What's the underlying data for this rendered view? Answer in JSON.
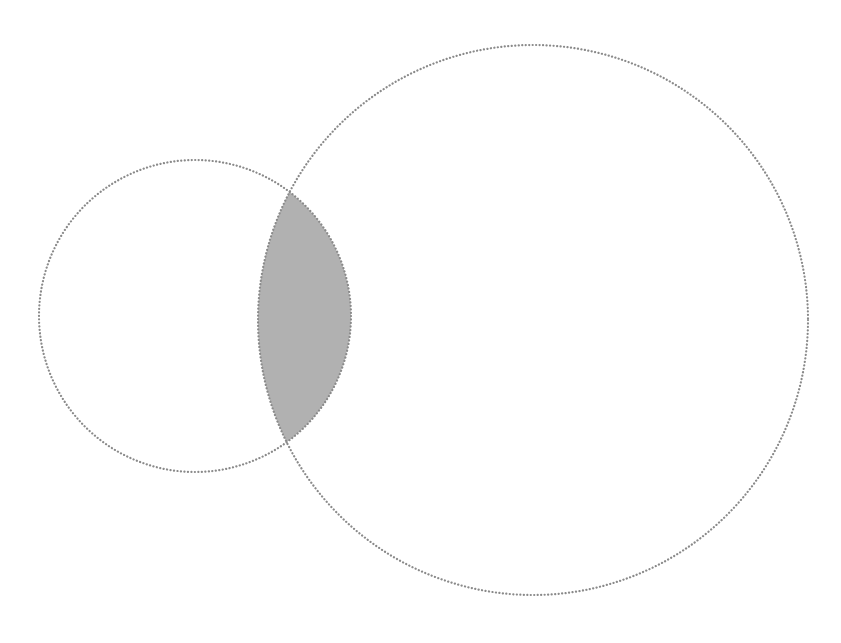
{
  "diagram": {
    "type": "venn",
    "background": "#ffffff",
    "stroke_color": "#8a8a8a",
    "overlap_fill": "#b1b1b1",
    "sets": [
      {
        "id": "left",
        "cx": 195,
        "cy": 316,
        "r": 156
      },
      {
        "id": "right",
        "cx": 533,
        "cy": 320,
        "r": 275
      }
    ],
    "overlap": {
      "top": {
        "x": 291,
        "y": 193
      },
      "bottom": {
        "x": 291,
        "y": 443
      }
    }
  }
}
